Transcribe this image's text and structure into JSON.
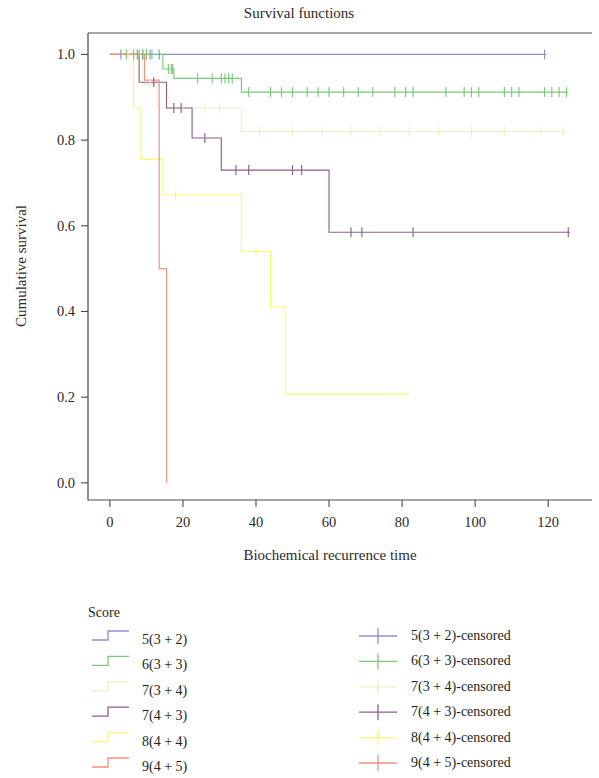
{
  "chart_data": {
    "type": "line",
    "subtype": "kaplan-meier-step",
    "title": "Survival functions",
    "xlabel": "Biochemical recurrence time",
    "ylabel": "Cumulative survival",
    "xlim": [
      -6,
      132
    ],
    "ylim": [
      -0.04,
      1.05
    ],
    "xticks": [
      0,
      20,
      40,
      60,
      80,
      100,
      120
    ],
    "xtick_labels": [
      "0",
      "20",
      "40",
      "60",
      "80",
      "100",
      "120"
    ],
    "yticks": [
      0.0,
      0.2,
      0.4,
      0.6,
      0.8,
      1.0
    ],
    "ytick_labels": [
      "0.0",
      "0.2",
      "0.4",
      "0.6",
      "0.8",
      "1.0"
    ],
    "grid": false,
    "legend_position": "below-plot",
    "legend_title": "Score",
    "series": [
      {
        "name": "5(3 + 2)",
        "censored_name": "5(3 + 2)-censored",
        "color": "#8f8fd0",
        "steps": [
          [
            0,
            1.0
          ],
          [
            119.5,
            1.0
          ]
        ],
        "censored_points": [
          [
            3.0,
            1.0
          ],
          [
            7.5,
            1.0
          ],
          [
            9.0,
            1.0
          ],
          [
            10.0,
            1.0
          ],
          [
            11.0,
            1.0
          ],
          [
            13.5,
            1.0
          ],
          [
            119.0,
            1.0
          ]
        ]
      },
      {
        "name": "6(3 + 3)",
        "censored_name": "6(3 + 3)-censored",
        "color": "#79c879",
        "steps": [
          [
            0,
            1.0
          ],
          [
            14.5,
            1.0
          ],
          [
            14.5,
            0.966
          ],
          [
            17.5,
            0.966
          ],
          [
            17.5,
            0.944
          ],
          [
            36.0,
            0.944
          ],
          [
            36.0,
            0.912
          ],
          [
            125.5,
            0.912
          ]
        ],
        "censored_points": [
          [
            4.5,
            1.0
          ],
          [
            6.5,
            1.0
          ],
          [
            8.0,
            1.0
          ],
          [
            9.0,
            1.0
          ],
          [
            10.0,
            1.0
          ],
          [
            11.5,
            1.0
          ],
          [
            16.0,
            0.966
          ],
          [
            16.8,
            0.966
          ],
          [
            17.2,
            0.966
          ],
          [
            24.0,
            0.944
          ],
          [
            28.0,
            0.944
          ],
          [
            30.5,
            0.944
          ],
          [
            31.5,
            0.944
          ],
          [
            32.5,
            0.944
          ],
          [
            33.5,
            0.944
          ],
          [
            38.0,
            0.912
          ],
          [
            44.0,
            0.912
          ],
          [
            47.0,
            0.912
          ],
          [
            50.0,
            0.912
          ],
          [
            54.0,
            0.912
          ],
          [
            57.0,
            0.912
          ],
          [
            60.0,
            0.912
          ],
          [
            64.0,
            0.912
          ],
          [
            68.0,
            0.912
          ],
          [
            72.0,
            0.912
          ],
          [
            78.0,
            0.912
          ],
          [
            81.0,
            0.912
          ],
          [
            83.0,
            0.912
          ],
          [
            92.0,
            0.912
          ],
          [
            97.0,
            0.912
          ],
          [
            99.0,
            0.912
          ],
          [
            101.0,
            0.912
          ],
          [
            108.0,
            0.912
          ],
          [
            110.0,
            0.912
          ],
          [
            112.0,
            0.912
          ],
          [
            119.0,
            0.912
          ],
          [
            121.0,
            0.912
          ],
          [
            123.0,
            0.912
          ],
          [
            125.0,
            0.912
          ]
        ]
      },
      {
        "name": "7(3 + 4)",
        "censored_name": "7(3 + 4)-censored",
        "color": "#edf0c8",
        "steps": [
          [
            0,
            1.0
          ],
          [
            9.0,
            1.0
          ],
          [
            9.0,
            0.93
          ],
          [
            13.0,
            0.93
          ],
          [
            13.0,
            0.875
          ],
          [
            18.5,
            0.875
          ],
          [
            18.5,
            0.875
          ],
          [
            36.0,
            0.875
          ],
          [
            36.0,
            0.82
          ],
          [
            125.0,
            0.82
          ]
        ],
        "censored_points": [
          [
            5.0,
            1.0
          ],
          [
            11.0,
            0.93
          ],
          [
            20.0,
            0.875
          ],
          [
            26.0,
            0.875
          ],
          [
            30.0,
            0.875
          ],
          [
            41.0,
            0.82
          ],
          [
            50.0,
            0.82
          ],
          [
            58.0,
            0.82
          ],
          [
            66.0,
            0.82
          ],
          [
            74.0,
            0.82
          ],
          [
            82.0,
            0.82
          ],
          [
            90.0,
            0.82
          ],
          [
            99.0,
            0.82
          ],
          [
            108.0,
            0.82
          ],
          [
            118.0,
            0.82
          ],
          [
            124.0,
            0.82
          ]
        ]
      },
      {
        "name": "7(4 + 3)",
        "censored_name": "7(4 + 3)-censored",
        "color": "#8d5f8d",
        "steps": [
          [
            0,
            1.0
          ],
          [
            8.0,
            1.0
          ],
          [
            8.0,
            0.935
          ],
          [
            15.5,
            0.935
          ],
          [
            15.5,
            0.875
          ],
          [
            22.5,
            0.875
          ],
          [
            22.5,
            0.805
          ],
          [
            30.5,
            0.805
          ],
          [
            30.5,
            0.73
          ],
          [
            60.0,
            0.73
          ],
          [
            60.0,
            0.585
          ],
          [
            126.0,
            0.585
          ]
        ],
        "censored_points": [
          [
            12.0,
            0.935
          ],
          [
            17.5,
            0.875
          ],
          [
            19.5,
            0.875
          ],
          [
            26.0,
            0.805
          ],
          [
            34.5,
            0.73
          ],
          [
            38.0,
            0.73
          ],
          [
            50.0,
            0.73
          ],
          [
            52.5,
            0.73
          ],
          [
            66.0,
            0.585
          ],
          [
            69.0,
            0.585
          ],
          [
            83.0,
            0.585
          ],
          [
            125.5,
            0.585
          ]
        ]
      },
      {
        "name": "8(4 + 4)",
        "censored_name": "8(4 + 4)-censored",
        "color": "#fbf871",
        "steps": [
          [
            0,
            1.0
          ],
          [
            6.5,
            1.0
          ],
          [
            6.5,
            0.875
          ],
          [
            8.5,
            0.875
          ],
          [
            8.5,
            0.755
          ],
          [
            14.5,
            0.755
          ],
          [
            14.5,
            0.672
          ],
          [
            36.0,
            0.672
          ],
          [
            36.0,
            0.54
          ],
          [
            44.0,
            0.54
          ],
          [
            44.0,
            0.41
          ],
          [
            48.0,
            0.41
          ],
          [
            48.0,
            0.207
          ],
          [
            82.0,
            0.207
          ]
        ],
        "censored_points": [
          [
            18.0,
            0.672
          ],
          [
            40.0,
            0.54
          ]
        ]
      },
      {
        "name": "9(4 + 5)",
        "censored_name": "9(4 + 5)-censored",
        "color": "#f4907e",
        "steps": [
          [
            0,
            1.0
          ],
          [
            9.5,
            1.0
          ],
          [
            9.5,
            0.94
          ],
          [
            13.5,
            0.94
          ],
          [
            13.5,
            0.5
          ],
          [
            15.5,
            0.5
          ],
          [
            15.5,
            0.0
          ]
        ],
        "censored_points": []
      }
    ]
  },
  "legend": {
    "heading": "Score",
    "left_items": [
      {
        "label": "5(3 + 2)",
        "color": "#8f8fd0"
      },
      {
        "label": "6(3 + 3)",
        "color": "#79c879"
      },
      {
        "label": "7(3 + 4)",
        "color": "#edf0c8"
      },
      {
        "label": "7(4 + 3)",
        "color": "#8d5f8d"
      },
      {
        "label": "8(4 + 4)",
        "color": "#fbf871"
      },
      {
        "label": "9(4 + 5)",
        "color": "#f4907e"
      }
    ],
    "right_items": [
      {
        "label": "5(3 + 2)-censored",
        "color": "#8f8fd0"
      },
      {
        "label": "6(3 + 3)-censored",
        "color": "#79c879"
      },
      {
        "label": "7(3 + 4)-censored",
        "color": "#edf0c8"
      },
      {
        "label": "7(4 + 3)-censored",
        "color": "#8d5f8d"
      },
      {
        "label": "8(4 + 4)-censored",
        "color": "#fbf871"
      },
      {
        "label": "9(4 + 5)-censored",
        "color": "#f4907e"
      }
    ]
  }
}
